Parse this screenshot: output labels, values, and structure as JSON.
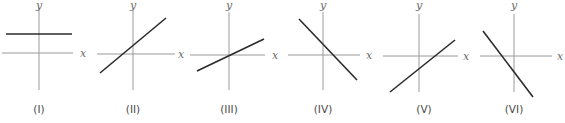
{
  "figure": {
    "axis_labels": {
      "x": "x",
      "y": "y"
    },
    "graphs": [
      {
        "caption": "(I)",
        "description": "horizontal line above x-axis",
        "slope": "zero",
        "intercept": "positive",
        "origin": [
          39,
          53
        ],
        "xaxis": [
          2,
          73
        ],
        "yaxis": [
          8,
          90
        ],
        "line": [
          6,
          34,
          72,
          34
        ],
        "xlabel_pos": [
          83,
          57
        ],
        "ylabel_pos": [
          39,
          9
        ],
        "caption_pos": [
          39,
          113
        ]
      },
      {
        "caption": "(II)",
        "description": "increasing line with positive y-intercept",
        "slope": "positive",
        "intercept": "positive",
        "origin": [
          133,
          54
        ],
        "xaxis": [
          97,
          175
        ],
        "yaxis": [
          10,
          90
        ],
        "line": [
          100,
          73,
          166,
          18
        ],
        "xlabel_pos": [
          181,
          58
        ],
        "ylabel_pos": [
          133,
          9
        ],
        "caption_pos": [
          133,
          113
        ]
      },
      {
        "caption": "(III)",
        "description": "increasing line through origin",
        "slope": "positive",
        "intercept": "zero",
        "origin": [
          229,
          55
        ],
        "xaxis": [
          190,
          265
        ],
        "yaxis": [
          12,
          90
        ],
        "line": [
          197,
          71,
          264,
          39
        ],
        "xlabel_pos": [
          275,
          59
        ],
        "ylabel_pos": [
          229,
          9
        ],
        "caption_pos": [
          229,
          113
        ]
      },
      {
        "caption": "(IV)",
        "description": "decreasing line with positive y-intercept",
        "slope": "negative",
        "intercept": "positive",
        "origin": [
          323,
          55
        ],
        "xaxis": [
          288,
          360
        ],
        "yaxis": [
          12,
          90
        ],
        "line": [
          299,
          19,
          357,
          80
        ],
        "xlabel_pos": [
          369,
          59
        ],
        "ylabel_pos": [
          323,
          9
        ],
        "caption_pos": [
          323,
          113
        ]
      },
      {
        "caption": "(V)",
        "description": "increasing line with negative y-intercept",
        "slope": "positive",
        "intercept": "negative",
        "origin": [
          419,
          56
        ],
        "xaxis": [
          383,
          458
        ],
        "yaxis": [
          14,
          92
        ],
        "line": [
          390,
          92,
          455,
          40
        ],
        "xlabel_pos": [
          466,
          60
        ],
        "ylabel_pos": [
          419,
          9
        ],
        "caption_pos": [
          424,
          113
        ]
      },
      {
        "caption": "(VI)",
        "description": "decreasing line with negative y-intercept",
        "slope": "negative",
        "intercept": "negative",
        "origin": [
          514,
          56
        ],
        "xaxis": [
          480,
          552
        ],
        "yaxis": [
          14,
          92
        ],
        "line": [
          483,
          31,
          533,
          97
        ],
        "xlabel_pos": [
          560,
          60
        ],
        "ylabel_pos": [
          514,
          9
        ],
        "caption_pos": [
          514,
          113
        ]
      }
    ],
    "colors": {
      "axis": "#9a9a9a",
      "line": "#2b2b2b",
      "label": "#6a6a6a",
      "caption": "#4a4a4a"
    }
  }
}
